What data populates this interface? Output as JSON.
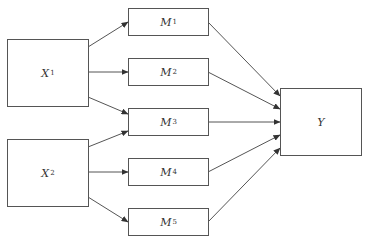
{
  "diagram": {
    "type": "mediation-path-diagram",
    "colors": {
      "stroke": "#555555",
      "text": "#333333",
      "background": "#ffffff"
    },
    "nodes": {
      "x1": {
        "base": "X",
        "sub": "1"
      },
      "x2": {
        "base": "X",
        "sub": "2"
      },
      "m1": {
        "base": "M",
        "sub": "1"
      },
      "m2": {
        "base": "M",
        "sub": "2"
      },
      "m3": {
        "base": "M",
        "sub": "3"
      },
      "m4": {
        "base": "M",
        "sub": "4"
      },
      "m5": {
        "base": "M",
        "sub": "5"
      },
      "y": {
        "base": "Y",
        "sub": ""
      }
    },
    "edges": [
      {
        "from": "X1",
        "to": "M1"
      },
      {
        "from": "X1",
        "to": "M2"
      },
      {
        "from": "X1",
        "to": "M3"
      },
      {
        "from": "X2",
        "to": "M3"
      },
      {
        "from": "X2",
        "to": "M4"
      },
      {
        "from": "X2",
        "to": "M5"
      },
      {
        "from": "M1",
        "to": "Y"
      },
      {
        "from": "M2",
        "to": "Y"
      },
      {
        "from": "M3",
        "to": "Y"
      },
      {
        "from": "M4",
        "to": "Y"
      },
      {
        "from": "M5",
        "to": "Y"
      }
    ]
  }
}
